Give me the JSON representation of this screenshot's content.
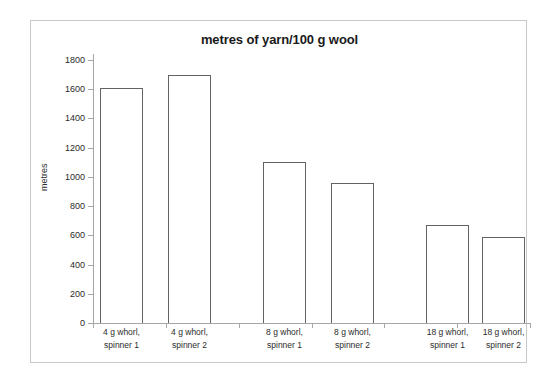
{
  "chart_data": {
    "type": "bar",
    "title": "metres of yarn/100 g wool",
    "xlabel": "",
    "ylabel": "metres",
    "ylim": [
      0,
      1800
    ],
    "ytick_step": 200,
    "yticks": [
      0,
      200,
      400,
      600,
      800,
      1000,
      1200,
      1400,
      1600,
      1800
    ],
    "ytick_labels": [
      "0",
      "200",
      "400",
      "600",
      "800",
      "1000",
      "1200",
      "1400",
      "1600",
      "1800"
    ],
    "grid": false,
    "legend": null,
    "bar_style": {
      "fill": "#ffffff",
      "edge": "#636363"
    },
    "categories": [
      "4 g whorl, spinner 1",
      "4 g whorl, spinner 2",
      "8 g whorl, spinner 1",
      "8 g whorl, spinner 2",
      "18 g whorl, spinner 1",
      "18 g whorl, spinner 2"
    ],
    "category_label_lines": [
      [
        "4 g whorl,",
        "spinner 1"
      ],
      [
        "4 g whorl,",
        "spinner 2"
      ],
      [
        "8 g whorl,",
        "spinner 1"
      ],
      [
        "8 g whorl,",
        "spinner 2"
      ],
      [
        "18 g whorl,",
        "spinner 1"
      ],
      [
        "18 g whorl,",
        "spinner 2"
      ]
    ],
    "values": [
      1610,
      1700,
      1100,
      960,
      670,
      590
    ]
  },
  "frame": {
    "border_color": "#c9c9c9",
    "axis_color": "#a6a6a6"
  }
}
